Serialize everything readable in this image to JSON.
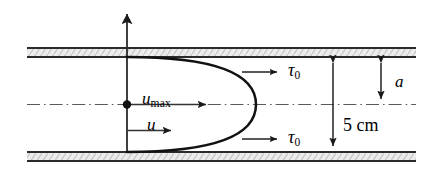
{
  "figure": {
    "colors": {
      "line": "#1a1a1a",
      "wall_fill": "#e8e8e8",
      "wall_hatch": "#b0b0b0",
      "centerline": "#555555",
      "background": "#ffffff"
    },
    "labels": {
      "u_max_symbol": "u",
      "u_max_subscript": "max",
      "u_symbol": "u",
      "tau_symbol": "τ",
      "tau_subscript": "0",
      "tau_top": "τ",
      "tau_top_sub": "0",
      "tau_bottom": "τ",
      "tau_bottom_sub": "0",
      "radius_label": "a",
      "diameter_label": "5 cm"
    },
    "geometry": {
      "pipe_left_x": 27,
      "pipe_right_x": 416,
      "top_wall_inner_y": 57,
      "bottom_wall_inner_y": 152,
      "centerline_y": 104.5,
      "wall_thickness": 9,
      "axis_x": 127,
      "axis_top_y": 12,
      "parabola_apex_x": 213,
      "u_arrow_tip_x": 175,
      "u_arrow_y": 130,
      "umax_arrow_tip_x": 209,
      "dim_diameter_x": 333,
      "dim_radius_x": 381,
      "tau_arrow_top_y": 72,
      "tau_arrow_bottom_y": 139,
      "tau_arrow_start_x": 242,
      "tau_arrow_end_x": 280
    }
  }
}
